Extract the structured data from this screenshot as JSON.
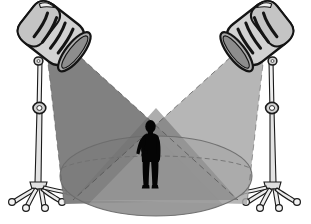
{
  "scene": {
    "title": "Two Stage Spotlights Illuminating a Standing Person",
    "background_color": "#ffffff",
    "width": 311,
    "height": 224
  },
  "palette": {
    "outline": "#1a1a1a",
    "paper_white": "#ffffff",
    "beam_left": "#7a7a7a",
    "beam_right": "#a9a9a9",
    "beam_overlap": "#6a6a6a",
    "floor_pool": "#9a9a9a",
    "floor_pool_shadow": "#8b8b8b",
    "fixture_body_light": "#d6d6d6",
    "fixture_body_mid": "#bdbdbd",
    "fixture_rim": "#9e9e9e",
    "fixture_lens": "#8f8f8f",
    "stand_metal": "#e8e8e8",
    "stand_metal_shade": "#c2c2c2",
    "figure_silhouette": "#050505"
  },
  "objects": [
    {
      "id": "spotlight-left",
      "label": "Left spotlight fixture",
      "position": "upper-left",
      "tilt_degrees": -38,
      "vent_slots": 4,
      "beam_direction": "down-right",
      "beam_tone": "dark-gray"
    },
    {
      "id": "spotlight-right",
      "label": "Right spotlight fixture",
      "position": "upper-right",
      "tilt_degrees": 38,
      "vent_slots": 4,
      "beam_direction": "down-left",
      "beam_tone": "light-gray"
    },
    {
      "id": "stand-left",
      "label": "Left telescoping tripod stand",
      "caster_count": 5,
      "has_height_collar": true
    },
    {
      "id": "stand-right",
      "label": "Right telescoping tripod stand",
      "caster_count": 5,
      "has_height_collar": true
    },
    {
      "id": "floor-pool",
      "label": "Elliptical lit stage floor",
      "shape": "ellipse"
    },
    {
      "id": "figure",
      "label": "Person silhouette standing with hand on hip",
      "pose": "standing, left arm akimbo",
      "fill": "black"
    }
  ],
  "geometry": {
    "beam_left_polygon": "128,50 155,60 235,215 70,200",
    "beam_right_polygon": "183,50 156,60 75,213 240,200",
    "floor_ellipse": {
      "cx": 156,
      "cy": 176,
      "rx": 96,
      "ry": 40
    },
    "floor_arc_cy": 160,
    "figure_center_x": 150,
    "figure_feet_y": 188
  },
  "labels": {
    "alt_text": "Black and white line drawing of two studio spotlights on rolling stands casting crossing light beams onto a dark silhouette of a person standing in an elliptical pool of light."
  }
}
